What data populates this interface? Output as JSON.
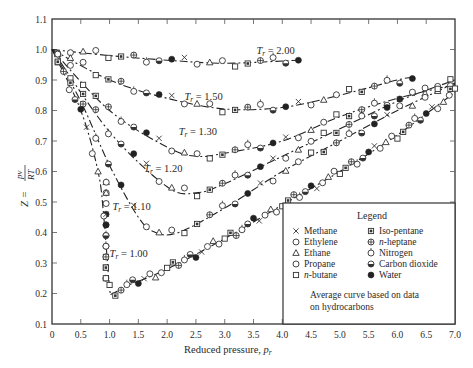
{
  "chart_data": {
    "type": "line",
    "title": "",
    "xlabel": "Reduced pressure, p_r",
    "ylabel": "Z = pv / RT",
    "xlim": [
      0,
      7.0
    ],
    "ylim": [
      0.1,
      1.1
    ],
    "xticks": [
      "0",
      "0.5",
      "1.0",
      "1.5",
      "2.0",
      "2.5",
      "3.0",
      "3.5",
      "4.0",
      "4.5",
      "5.0",
      "5.5",
      "6.0",
      "6.5",
      "7.0"
    ],
    "yticks": [
      "0.1",
      "0.2",
      "0.3",
      "0.4",
      "0.5",
      "0.6",
      "0.7",
      "0.8",
      "0.9",
      "1.0",
      "1.1"
    ],
    "grid": false,
    "series": [
      {
        "name": "T_r = 2.00",
        "label_pos": [
          3.55,
          0.985
        ],
        "x": [
          0,
          1,
          2,
          3,
          4.3
        ],
        "y": [
          1.0,
          0.98,
          0.965,
          0.955,
          0.965
        ]
      },
      {
        "name": "T_r = 1.50",
        "label_pos": [
          2.3,
          0.835
        ],
        "x": [
          0,
          1,
          2,
          3,
          4,
          5,
          6,
          6.3
        ],
        "y": [
          1.0,
          0.9,
          0.84,
          0.805,
          0.81,
          0.85,
          0.9,
          0.91
        ]
      },
      {
        "name": "T_r = 1.30",
        "label_pos": [
          2.2,
          0.72
        ],
        "x": [
          0,
          1,
          2,
          2.5,
          3,
          4,
          5,
          6,
          7
        ],
        "y": [
          1.0,
          0.8,
          0.68,
          0.65,
          0.66,
          0.7,
          0.78,
          0.84,
          0.885
        ]
      },
      {
        "name": "T_r = 1.20",
        "label_pos": [
          1.6,
          0.6
        ],
        "x": [
          0,
          1,
          2,
          2.5,
          3,
          4,
          5,
          6,
          7
        ],
        "y": [
          1.0,
          0.73,
          0.55,
          0.53,
          0.56,
          0.65,
          0.74,
          0.83,
          0.9
        ]
      },
      {
        "name": "T_r = 1.10",
        "label_pos": [
          1.05,
          0.475
        ],
        "x": [
          0,
          0.5,
          1,
          1.5,
          1.8,
          2.2,
          3,
          4,
          5,
          6,
          7
        ],
        "y": [
          1.0,
          0.83,
          0.62,
          0.45,
          0.4,
          0.4,
          0.48,
          0.6,
          0.7,
          0.8,
          0.89
        ]
      },
      {
        "name": "T_r = 1.00",
        "label_pos": [
          1.0,
          0.32
        ],
        "x": [
          0,
          0.5,
          0.8,
          0.9,
          1.0,
          1.05,
          1.3,
          2,
          3,
          4,
          5,
          6,
          7
        ],
        "y": [
          1.0,
          0.8,
          0.6,
          0.45,
          0.22,
          0.2,
          0.225,
          0.28,
          0.38,
          0.49,
          0.6,
          0.72,
          0.86
        ]
      }
    ],
    "legend": {
      "title": "Legend",
      "position": "lower right",
      "entries": [
        {
          "symbol": "cross",
          "label": "Methane"
        },
        {
          "symbol": "circle",
          "label": "Ethylene"
        },
        {
          "symbol": "triangle",
          "label": "Ethane"
        },
        {
          "symbol": "circle",
          "label": "Propane"
        },
        {
          "symbol": "square",
          "label": "n-butane"
        },
        {
          "symbol": "square-dot",
          "label": "Iso-pentane"
        },
        {
          "symbol": "circle-cross",
          "label": "n-heptane"
        },
        {
          "symbol": "circle-tick",
          "label": "Nitrogen"
        },
        {
          "symbol": "circle-half",
          "label": "Carbon dioxide"
        },
        {
          "symbol": "filled-circle",
          "label": "Water"
        }
      ],
      "note": "Average curve based on data on hydrocarbons"
    }
  },
  "labels": {
    "ylabel_prefix": "Z =",
    "ylabel_num": "pv",
    "ylabel_den": "RT",
    "xlabel_text": "Reduced pressure, ",
    "xlabel_var": "p",
    "xlabel_sub": "r",
    "legend_title": "Legend",
    "note_line1": "Average curve based on data",
    "note_line2": "on hydrocarbons"
  }
}
